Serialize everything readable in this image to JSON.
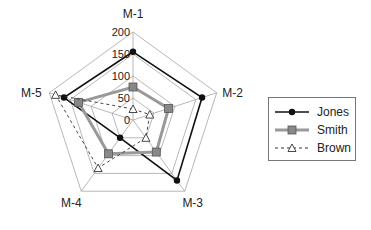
{
  "chart_data": {
    "type": "radar",
    "title": "",
    "axes": [
      "M-1",
      "M-2",
      "M-3",
      "M-4",
      "M-5"
    ],
    "ticks": [
      0,
      50,
      100,
      150,
      200
    ],
    "rlim": [
      0,
      200
    ],
    "grid": true,
    "legend_position": "right",
    "series": [
      {
        "name": "Jones",
        "values": [
          155,
          165,
          170,
          50,
          165
        ],
        "color": "#111111",
        "marker": "circle",
        "line": "solid"
      },
      {
        "name": "Smith",
        "values": [
          75,
          85,
          90,
          95,
          130
        ],
        "color": "#888888",
        "marker": "square",
        "line": "solid-thick"
      },
      {
        "name": "Brown",
        "values": [
          25,
          40,
          50,
          135,
          185
        ],
        "color": "#333333",
        "marker": "triangle-open",
        "line": "dashed"
      }
    ]
  },
  "legend": {
    "items": [
      {
        "label": "Jones"
      },
      {
        "label": "Smith"
      },
      {
        "label": "Brown"
      }
    ]
  }
}
